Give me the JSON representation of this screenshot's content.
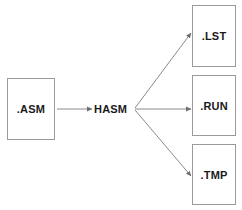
{
  "diagram": {
    "type": "flow-diagram",
    "colors": {
      "background": "#ffffff",
      "box_border": "#9a9a9a",
      "box_fill": "#ffffff",
      "edge": "#8a8a8a",
      "text": "#1a1a1a"
    },
    "input": {
      "label": ".ASM",
      "name": "asm-source-file"
    },
    "process": {
      "label": "HASM",
      "name": "hasm-assembler"
    },
    "outputs": [
      {
        "label": ".LST",
        "name": "lst-listing-file"
      },
      {
        "label": ".RUN",
        "name": "run-executable-file"
      },
      {
        "label": ".TMP",
        "name": "tmp-temporary-file"
      }
    ],
    "edges": [
      {
        "from": ".ASM",
        "to": "HASM",
        "style": "solid-arrow"
      },
      {
        "from": "HASM",
        "to": ".LST",
        "style": "solid-arrow"
      },
      {
        "from": "HASM",
        "to": ".RUN",
        "style": "solid-arrow"
      },
      {
        "from": "HASM",
        "to": ".TMP",
        "style": "solid-arrow"
      }
    ]
  }
}
